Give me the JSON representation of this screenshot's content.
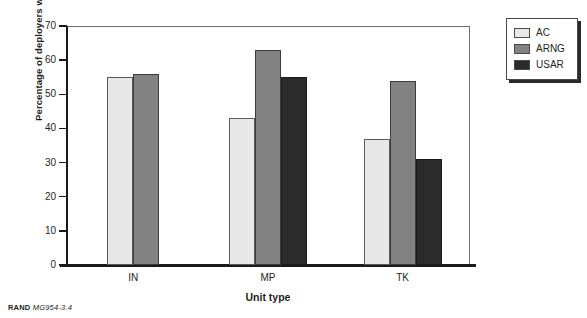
{
  "chart_data": {
    "type": "bar",
    "title": "",
    "xlabel": "Unit type",
    "ylabel": "Percentage of deployers who are stable",
    "categories": [
      "IN",
      "MP",
      "TK"
    ],
    "series": [
      {
        "name": "AC",
        "color": "#e8e8e8",
        "values": [
          55,
          43,
          37
        ]
      },
      {
        "name": "ARNG",
        "color": "#828282",
        "values": [
          56,
          63,
          54
        ]
      },
      {
        "name": "USAR",
        "color": "#2b2b2b",
        "values": [
          null,
          55,
          31
        ]
      }
    ],
    "ylim": [
      0,
      70
    ],
    "ytick_values": [
      0,
      10,
      20,
      30,
      40,
      50,
      60,
      70
    ],
    "ytick_labels": [
      "0",
      "10",
      "20",
      "30",
      "40",
      "50",
      "60",
      "70"
    ],
    "grid": false,
    "legend_position": "right-top"
  },
  "legend": {
    "items": [
      {
        "label": "AC",
        "swatch": "sw-ac"
      },
      {
        "label": "ARNG",
        "swatch": "sw-arng"
      },
      {
        "label": "USAR",
        "swatch": "sw-usar"
      }
    ]
  },
  "credit": {
    "source": "RAND",
    "figure_number": "MG954-3.4"
  }
}
